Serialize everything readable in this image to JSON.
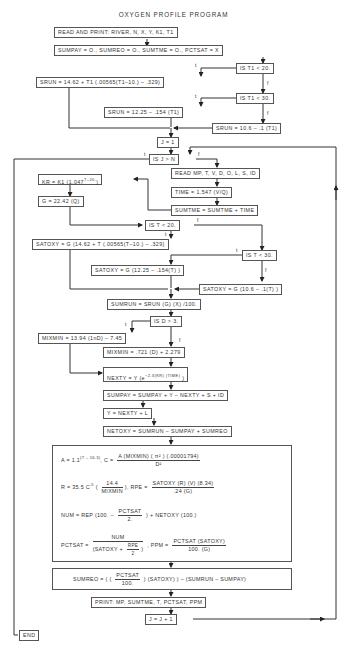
{
  "title": "OXYGEN PROFILE PROGRAM",
  "labels": {
    "t": "t",
    "f": "f"
  },
  "boxes": {
    "read_print": "READ AND PRINT:  RIVER, N, X, Y, K1, T1",
    "init": "SUMPAY = O., SUMREO = O., SUMTME = O., PCTSAT = X",
    "is_t1_20": "IS  T1  <  20.",
    "srun_1": "SRUN  =  14.62  +  T1  (.00565(T1–10.)  –  .329)",
    "is_t1_30": "IS  T1  <  30.",
    "srun_2": "SRUN  =  12.25  –  .154  (T1)",
    "srun_3": "SRUN  =  10.6  –  .1  (T1)",
    "j_init": "J  =  1",
    "is_j_n": "IS  J  >  N",
    "read_mp": "READ MP, T, V, D, O, L, S, ID",
    "kr": "KR  =  K1  (1.047",
    "kr_exp": "T–20.",
    "kr_close": ")",
    "time": "TIME  =  1.547  (V/Q)",
    "g": "G  =  22.42  (Q)",
    "sumtme": "SUMTME = SUMTME  +  TIME",
    "is_t_20": "IS  T  <  20.",
    "satoxy_1": "SATOXY  =  G  (14.62  +  T  (.00565(T–10.)  –  .329)",
    "is_t_30": "IS  T  <  30.",
    "satoxy_2": "SATOXY  =  G  (12.25  –  .154(T)  )",
    "satoxy_3": "SATOXY  =  G  (10.6  –  .1(T)  )",
    "sumrun": "SUMRUN  =  SRUN  (G)  (X)  /100.",
    "is_d_3": "IS  D  >  3.",
    "mixmin_1": "MIXMIN  =  13.94  (1nD)  –  7.45",
    "mixmin_2": "MIXMIN  =  .721  (D)  +  2.279",
    "nexty": "NEXTY  =  Y  (e",
    "nexty_exp": "−2.3(KR)  (TIME)",
    "nexty_close": "  )",
    "sumpay": "SUMPAY = SUMPAY  +  Y  –  NEXTY  +  S  +  ID",
    "y_next": "Y  =  NEXTY  +  L",
    "netoxy": "NETOXY  =  SUMRUN  –  SUMPAY  +  SUMREO",
    "print": "PRINT:    MP, SUMTME,  T,  PCTSAT,  PPM",
    "j_inc": "J  =  J  +  1",
    "end": "END"
  },
  "calc_block": {
    "a_lhs": "A  =  1.1",
    "a_exp": "(T  –  16.3)",
    "c_lhs": ",   C  =",
    "c_num": "A  (MIXMIN)  ( π² )  (.00001794)",
    "c_den": "D²",
    "r_lhs": "R  =  35.5  C",
    "r_exp": ".5",
    "r_open": " (",
    "r_num": "14.4",
    "r_den": "MIXMIN",
    "r_close": "),  RPE  =",
    "rpe_num": "SATOXY  (R)  (V)  (8.34)",
    "rpe_den": ".24  (G)",
    "num_lhs": "NUM  =  REP  (100.  –",
    "num_frac_num": "PCTSAT",
    "num_frac_den": "2.",
    "num_rest": ")  +  NETOXY  (100.)",
    "pct_lhs": "PCTSAT  =",
    "pct_num": "NUM",
    "pct_den_a": "(SATOXY  +",
    "pct_den_fn": "RPE",
    "pct_den_fd": "2",
    "pct_den_b": ")",
    "ppm_lhs": ",  PPM  =",
    "ppm_num": "PCTSAT  (SATOXY)",
    "ppm_den": "100.  (G)"
  },
  "sumreo_block": {
    "lhs": "SUMREO  =  ( (",
    "num": "PCTSAT",
    "den": "100.",
    "rest": ") (SATOXY) )  –  (SUMRUN  –  SUMPAY)"
  }
}
